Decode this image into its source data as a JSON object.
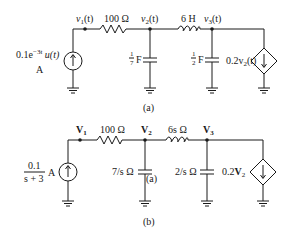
{
  "circuit_a": {
    "caption": "(a)",
    "source": {
      "value": "0.1e",
      "exp": "−3t",
      "suffix": " u(t)",
      "unit": "A"
    },
    "nodes": [
      {
        "name": "v",
        "sub": "1",
        "arg": "(t)"
      },
      {
        "name": "v",
        "sub": "2",
        "arg": "(t)"
      },
      {
        "name": "v",
        "sub": "3",
        "arg": "(t)"
      }
    ],
    "resistor": "100 Ω",
    "inductor": "6 H",
    "cap1": {
      "num": "1",
      "den": "7",
      "unit": "F"
    },
    "cap2": {
      "num": "1",
      "den": "2",
      "unit": "F"
    },
    "dep_source": {
      "coef": "0.2v",
      "sub": "2",
      "arg": "(t)"
    }
  },
  "circuit_b": {
    "caption": "(b)",
    "source": {
      "num": "0.1",
      "den": "s + 3",
      "unit": "A"
    },
    "nodes": [
      {
        "name": "V",
        "sub": "1"
      },
      {
        "name": "V",
        "sub": "2"
      },
      {
        "name": "V",
        "sub": "3"
      }
    ],
    "resistor": "100 Ω",
    "inductor": "6s Ω",
    "cap1": "7/s Ω",
    "cap1_note": "(a)",
    "cap2": "2/s Ω",
    "dep_source": {
      "coef": "0.2",
      "var": "V",
      "sub": "2"
    }
  }
}
